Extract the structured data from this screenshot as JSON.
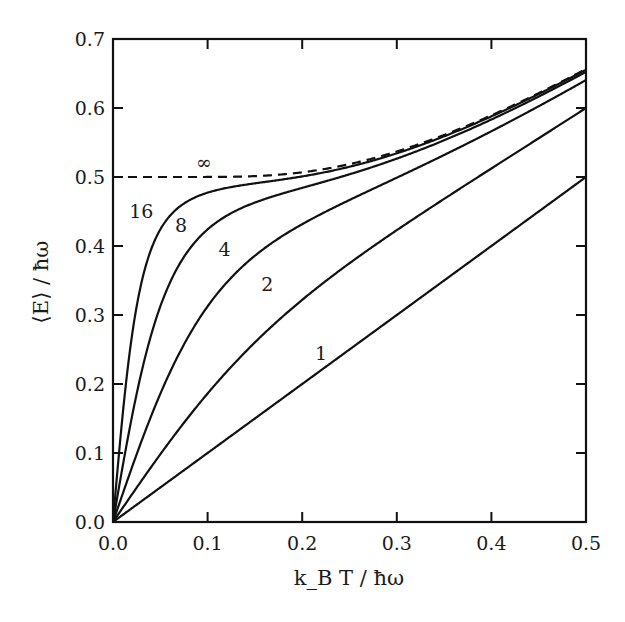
{
  "chart_data": {
    "type": "line",
    "title": "",
    "xlabel": "k_B T / ħω",
    "ylabel": "⟨E⟩ / ħω",
    "xlim": [
      0.0,
      0.5
    ],
    "ylim": [
      0.0,
      0.7
    ],
    "grid": false,
    "legend": "inline curve labels",
    "x_ticks": [
      "0.0",
      "0.1",
      "0.2",
      "0.3",
      "0.4",
      "0.5"
    ],
    "y_ticks": [
      "0.0",
      "0.1",
      "0.2",
      "0.3",
      "0.4",
      "0.5",
      "0.6",
      "0.7"
    ],
    "x": [
      0.0,
      0.05,
      0.1,
      0.15,
      0.2,
      0.25,
      0.3,
      0.35,
      0.4,
      0.45,
      0.5
    ],
    "series": [
      {
        "name": "1",
        "P": 1,
        "style": "solid",
        "label_pos": [
          0.22,
          0.235
        ],
        "values": [
          0.0,
          0.05,
          0.1,
          0.15,
          0.2,
          0.25,
          0.3,
          0.35,
          0.4,
          0.45,
          0.5
        ]
      },
      {
        "name": "2",
        "P": 2,
        "style": "solid",
        "label_pos": [
          0.163,
          0.335
        ],
        "values": [
          0.0,
          0.099,
          0.193,
          0.262,
          0.325,
          0.381,
          0.433,
          0.482,
          0.528,
          0.566,
          0.6
        ]
      },
      {
        "name": "4",
        "P": 4,
        "style": "solid",
        "label_pos": [
          0.118,
          0.385
        ],
        "values": [
          0.0,
          0.19,
          0.331,
          0.405,
          0.448,
          0.479,
          0.507,
          0.535,
          0.566,
          0.599,
          0.635
        ]
      },
      {
        "name": "8",
        "P": 8,
        "style": "solid",
        "label_pos": [
          0.072,
          0.42
        ],
        "values": [
          0.0,
          0.33,
          0.445,
          0.48,
          0.495,
          0.508,
          0.527,
          0.55,
          0.575,
          0.603,
          0.648
        ]
      },
      {
        "name": "16",
        "P": 16,
        "style": "solid",
        "label_pos": [
          0.03,
          0.44
        ],
        "values": [
          0.0,
          0.445,
          0.488,
          0.497,
          0.504,
          0.516,
          0.532,
          0.553,
          0.577,
          0.604,
          0.654
        ]
      },
      {
        "name": "∞",
        "P": null,
        "style": "dashed",
        "label_pos": [
          0.096,
          0.512
        ],
        "values": [
          0.5,
          0.5,
          0.5003,
          0.5025,
          0.5074,
          0.5181,
          0.5335,
          0.5527,
          0.5752,
          0.6008,
          0.6565
        ]
      }
    ]
  },
  "colors": {
    "line": "#111111",
    "background": "#ffffff"
  }
}
